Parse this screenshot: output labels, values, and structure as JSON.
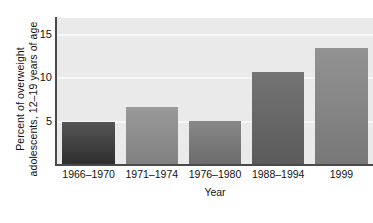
{
  "chart_data": {
    "type": "bar",
    "title": "",
    "xlabel": "Year",
    "ylabel": "Percent of overweight adolescents, 12–19 years of age",
    "ylabel_line1": "Percent of overweight",
    "ylabel_line2": "adolescents, 12–19 years of age",
    "categories": [
      "1966–1970",
      "1971–1974",
      "1976–1980",
      "1988–1994",
      "1999"
    ],
    "values": [
      5.0,
      6.7,
      5.1,
      10.7,
      13.5
    ],
    "ylim": [
      0,
      16.9
    ],
    "ytick_labels": [
      "5",
      "10",
      "15"
    ],
    "ytick_values": [
      5,
      10,
      15
    ],
    "grid": true,
    "gridline_color": "#f7f7f7",
    "legend": "none",
    "plot_background": "#eaeaea",
    "axis_color": "#4a4a4a",
    "bar_colors": [
      "#4a4a4a",
      "#8e8e8e",
      "#7a7a7a",
      "#666666",
      "#848484"
    ]
  },
  "figure": {
    "background": "#ffffff"
  }
}
